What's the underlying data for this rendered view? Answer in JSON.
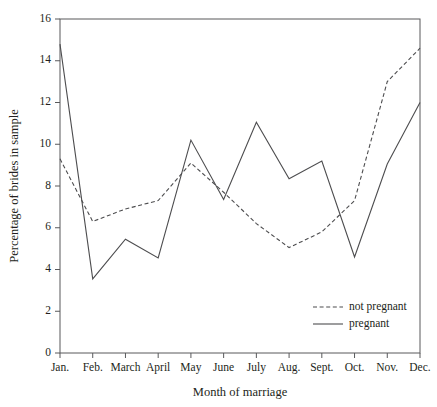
{
  "chart_data": {
    "type": "line",
    "title": "",
    "xlabel": "Month of marriage",
    "ylabel": "Percentage of brides in sample",
    "categories": [
      "Jan.",
      "Feb.",
      "March",
      "April",
      "May",
      "June",
      "July",
      "Aug.",
      "Sept.",
      "Oct.",
      "Nov.",
      "Dec."
    ],
    "ylim": [
      0,
      16
    ],
    "yticks": [
      0,
      2,
      4,
      6,
      8,
      10,
      12,
      14,
      16
    ],
    "ytick_labels": [
      "0",
      "2",
      "4",
      "6",
      "8",
      "10",
      "12",
      "14",
      "16"
    ],
    "grid": false,
    "legend_position": "bottom-right",
    "series": [
      {
        "name": "not pregnant",
        "style": "dashed",
        "color": "#4d4d4f",
        "values": [
          9.3,
          6.3,
          6.9,
          7.3,
          9.1,
          7.7,
          6.2,
          5.05,
          5.8,
          7.3,
          13.0,
          14.6
        ]
      },
      {
        "name": "pregnant",
        "style": "solid",
        "color": "#4d4d4f",
        "values": [
          14.8,
          3.55,
          5.45,
          4.55,
          10.2,
          7.35,
          11.05,
          8.35,
          9.2,
          4.6,
          9.05,
          12.0
        ]
      }
    ]
  },
  "legend": {
    "items": [
      {
        "label": "not pregnant",
        "style": "dashed"
      },
      {
        "label": "pregnant",
        "style": "solid"
      }
    ]
  }
}
